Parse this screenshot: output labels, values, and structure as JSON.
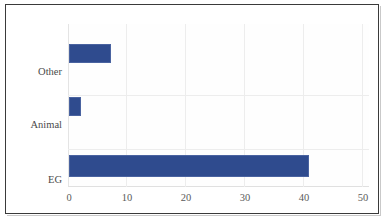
{
  "chart_data": {
    "type": "bar",
    "orientation": "horizontal",
    "title": "",
    "subtitle": "",
    "xlabel": "",
    "ylabel": "",
    "categories": [
      "EG",
      "Animal",
      "Other"
    ],
    "values": [
      40,
      2,
      7
    ],
    "series": [
      {
        "name": "",
        "values": [
          40,
          2,
          7
        ],
        "color": "#2F4B8E"
      }
    ],
    "xlim": [
      0,
      50
    ],
    "xticks": [
      0,
      10,
      20,
      30,
      40,
      50
    ],
    "xtick_labels": [
      "0",
      "10",
      "20",
      "30",
      "40",
      "50"
    ],
    "ytick_labels": [
      "EG",
      "Animal",
      "Other"
    ],
    "grid": true,
    "grid_axis": "x",
    "legend": false,
    "legend_position": "none",
    "annotations": []
  },
  "style": {
    "bar_color": "#2F4B8E",
    "bar_edge_color": "#4A63A0",
    "gridline_color": "#EDEDED",
    "frame_color": "#3A3A3A",
    "plot_background": "#FEFEFE",
    "figure_background": "#FFFFFF",
    "label_color": "#4A4A4A",
    "tick_color": "#5A5A5A"
  }
}
